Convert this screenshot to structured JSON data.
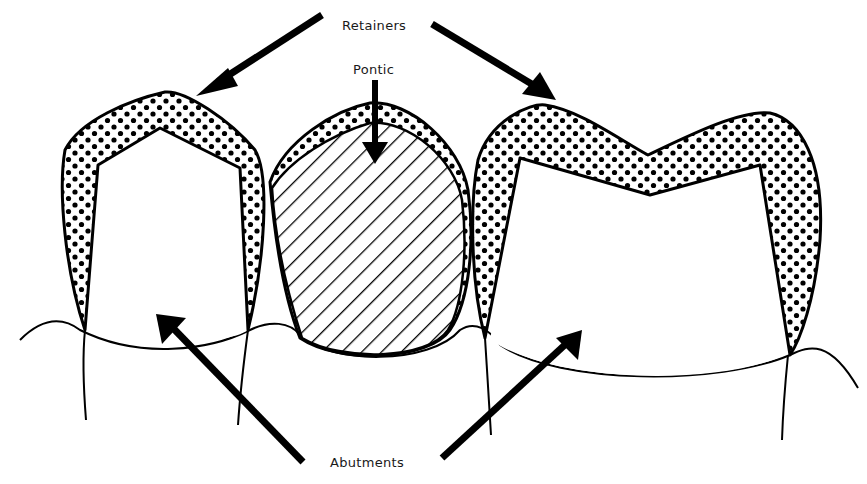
{
  "diagram": {
    "labels": {
      "retainers": "Retainers",
      "pontic": "Pontic",
      "abutments": "Abutments"
    },
    "components": [
      {
        "name": "left-retainer",
        "type": "retainer",
        "fill": "dotted"
      },
      {
        "name": "pontic",
        "type": "pontic",
        "fill": "hatched"
      },
      {
        "name": "right-retainer",
        "type": "retainer",
        "fill": "dotted"
      },
      {
        "name": "left-abutment",
        "type": "abutment"
      },
      {
        "name": "right-abutment",
        "type": "abutment"
      }
    ],
    "colors": {
      "line": "#000000",
      "background": "#ffffff"
    }
  }
}
